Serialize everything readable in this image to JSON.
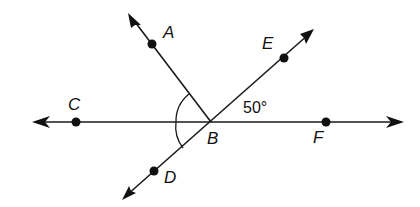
{
  "diagram": {
    "type": "geometry-angles",
    "vertex": {
      "label": "B",
      "x": 211,
      "y": 122
    },
    "lines": [
      {
        "name": "line-CF",
        "through": [
          "C",
          "B",
          "F"
        ],
        "from": [
          32,
          122
        ],
        "to": [
          403,
          122
        ],
        "arrows": "both"
      },
      {
        "name": "line-DE",
        "through": [
          "D",
          "B",
          "E"
        ],
        "from": [
          122,
          200
        ],
        "to": [
          314,
          29
        ],
        "arrows": "both"
      },
      {
        "name": "ray-BA",
        "through": [
          "B",
          "A"
        ],
        "from": [
          211,
          122
        ],
        "to": [
          128,
          13
        ],
        "arrows": "end"
      }
    ],
    "points": [
      {
        "label": "A",
        "x": 152,
        "y": 44,
        "label_x": 163,
        "label_y": 38
      },
      {
        "label": "E",
        "x": 284,
        "y": 58,
        "label_x": 262,
        "label_y": 49
      },
      {
        "label": "C",
        "x": 76,
        "y": 122,
        "label_x": 68,
        "label_y": 110
      },
      {
        "label": "F",
        "x": 326,
        "y": 122,
        "label_x": 313,
        "label_y": 143
      },
      {
        "label": "D",
        "x": 154,
        "y": 171,
        "label_x": 164,
        "label_y": 183
      },
      {
        "label": "B",
        "x": 211,
        "y": 122,
        "label_x": 207,
        "label_y": 143
      }
    ],
    "angle_marks": [
      {
        "name": "angle-ABC",
        "between": [
          "A",
          "C"
        ],
        "marked": true
      },
      {
        "name": "angle-CBD",
        "between": [
          "C",
          "D"
        ],
        "marked": true
      }
    ],
    "angle_labels": [
      {
        "name": "angle-EBF",
        "text": "50°",
        "x": 243,
        "y": 113
      }
    ],
    "colors": {
      "line": "#1a1a1a",
      "background": "#ffffff"
    }
  }
}
